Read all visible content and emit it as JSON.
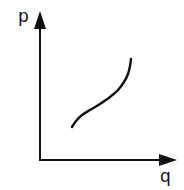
{
  "chart_data": {
    "type": "line",
    "title": "",
    "xlabel": "q",
    "ylabel": "p",
    "grid": false,
    "legend": null,
    "ticks": {
      "x": [],
      "y": []
    },
    "axis_origin_px": [
      40,
      160
    ],
    "y_axis_top_px": 12,
    "x_axis_right_px": 176,
    "series": [
      {
        "name": "curve",
        "description": "S-shaped increasing curve (concave then convex)",
        "points_px": [
          [
            72,
            127
          ],
          [
            76,
            121
          ],
          [
            82,
            115
          ],
          [
            90,
            110
          ],
          [
            100,
            104
          ],
          [
            110,
            97
          ],
          [
            118,
            90
          ],
          [
            124,
            82
          ],
          [
            128,
            74
          ],
          [
            130,
            66
          ],
          [
            131,
            59
          ]
        ]
      }
    ],
    "colors": {
      "axes": "#111111",
      "curve": "#111111",
      "background": "#ffffff"
    }
  }
}
